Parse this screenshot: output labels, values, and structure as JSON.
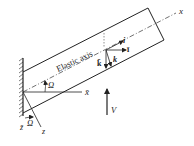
{
  "diagram": {
    "labels": {
      "x_axis": "x",
      "x_bar": "x̄",
      "z_axis": "z",
      "z_bar": "z̄",
      "omega_top": "Ω",
      "omega_bottom": "Ω",
      "elastic_axis": "Elastic axis",
      "i_vec": "i",
      "i_bar_vec": "ī",
      "k_vec": "k",
      "k_bar_vec": "k̄",
      "force": "V"
    },
    "colors": {
      "stroke": "#222222",
      "background": "#ffffff"
    }
  }
}
